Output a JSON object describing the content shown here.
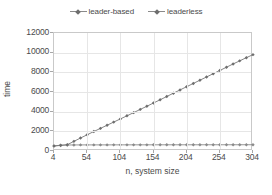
{
  "chart_data": {
    "type": "line",
    "title": "",
    "subtitle": "",
    "xlabel": "n, system size",
    "ylabel": "time",
    "xlim": [
      4,
      304
    ],
    "ylim": [
      0,
      12000
    ],
    "xticks": [
      4,
      54,
      104,
      154,
      204,
      254,
      304
    ],
    "yticks": [
      0,
      2000,
      4000,
      6000,
      8000,
      10000,
      12000
    ],
    "grid": true,
    "legend_position": "top-center",
    "colors": {
      "leader_based": "#6e6e6e",
      "leaderless": "#8a8a8a",
      "axis": "#c9c9c9",
      "grid": "#e6e6e6",
      "text": "#4a4a4a"
    },
    "x": [
      4,
      14,
      24,
      34,
      44,
      54,
      64,
      74,
      84,
      94,
      104,
      114,
      124,
      134,
      144,
      154,
      164,
      174,
      184,
      194,
      204,
      214,
      224,
      234,
      244,
      254,
      264,
      274,
      284,
      294,
      304
    ],
    "series": [
      {
        "name": "leader-based",
        "marker": "diamond",
        "values": [
          520,
          560,
          640,
          980,
          1320,
          1650,
          1980,
          2300,
          2620,
          2940,
          3260,
          3580,
          3900,
          4230,
          4550,
          4880,
          5210,
          5540,
          5880,
          6210,
          6540,
          6870,
          7200,
          7530,
          7860,
          8190,
          8520,
          8850,
          9170,
          9490,
          9800
        ]
      },
      {
        "name": "leaderless",
        "marker": "diamond",
        "values": [
          500,
          600,
          610,
          615,
          618,
          620,
          620,
          622,
          622,
          624,
          624,
          625,
          626,
          626,
          627,
          628,
          628,
          629,
          630,
          630,
          631,
          632,
          632,
          633,
          634,
          634,
          635,
          636,
          636,
          637,
          638
        ]
      }
    ]
  },
  "legend": {
    "entries": [
      {
        "label": "leader-based"
      },
      {
        "label": "leaderless"
      }
    ]
  },
  "axes": {
    "y_title": "time",
    "x_title": "n, system size",
    "y_tick_labels": [
      "12000",
      "10000",
      "8000",
      "6000",
      "4000",
      "2000",
      "0"
    ],
    "x_tick_labels": [
      "4",
      "54",
      "104",
      "154",
      "204",
      "254",
      "304"
    ]
  }
}
